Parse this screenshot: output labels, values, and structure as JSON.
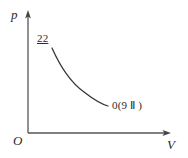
{
  "figure": {
    "kind": "pressure-volume-diagram",
    "background_color": "#ffffff",
    "ink_color": "#2b2b2b"
  },
  "axes": {
    "vertical_label": "p",
    "horizontal_label": "V",
    "origin_label": "O",
    "vertical_axis": {
      "x": 28,
      "y_top": 12,
      "y_bottom": 133,
      "arrow": "up"
    },
    "horizontal_axis": {
      "y": 133,
      "x_left": 28,
      "x_right": 170,
      "arrow": "right"
    },
    "ticks": "none",
    "grid": "off"
  },
  "annotations": {
    "start_label": "22",
    "start_label_underlined": true,
    "end_label": "0(9 Ⅱ )"
  },
  "chart_data": {
    "type": "line",
    "title": "",
    "xlabel": "V",
    "ylabel": "p",
    "grid": false,
    "legend": "none",
    "curve_description": "monotonically decreasing convex hyperbola-like isotherm",
    "curve_points_px": [
      [
        52,
        48
      ],
      [
        58,
        58
      ],
      [
        64,
        67
      ],
      [
        70,
        75
      ],
      [
        77,
        83
      ],
      [
        85,
        91
      ],
      [
        94,
        98
      ],
      [
        102,
        103
      ],
      [
        108,
        106
      ]
    ],
    "curve_path": "M 52 48 C 60 66, 70 82, 84 92 C 93 99, 101 104, 108 106",
    "annotations": [
      {
        "text": "22",
        "at_px": [
          44,
          40
        ],
        "target_px": [
          52,
          48
        ]
      },
      {
        "text": "0(9 Ⅱ )",
        "at_px": [
          112,
          106
        ],
        "target_px": [
          108,
          106
        ]
      }
    ]
  }
}
